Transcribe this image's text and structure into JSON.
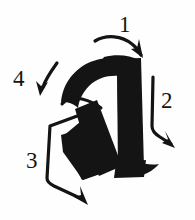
{
  "figure": {
    "glyph": "a",
    "glyph_description": "bold lowercase letter a drawn in thick black brush ink",
    "background_color": "#fefefe",
    "ink_color": "#141414",
    "width": 195,
    "height": 220
  },
  "annotations": {
    "count": 4,
    "items": [
      {
        "label": "1",
        "name": "stroke-1",
        "description": "curved arrow entering from upper left, pointing down-right onto the top arch of the a",
        "label_x": 125,
        "label_y": 32,
        "direction": "right-down"
      },
      {
        "label": "2",
        "name": "stroke-2",
        "description": "vertical arrow on the right side pointing downward along the stem of the a",
        "label_x": 163,
        "label_y": 108,
        "direction": "down"
      },
      {
        "label": "3",
        "name": "stroke-3",
        "description": "bracket arrow on the lower left running down then diagonally right to the baseline",
        "label_x": 26,
        "label_y": 168,
        "direction": "down-right"
      },
      {
        "label": "4",
        "name": "stroke-4",
        "description": "short curved arrow on the upper left pointing down-left into the bowl of the a",
        "label_x": 14,
        "label_y": 86,
        "direction": "down-left"
      }
    ]
  }
}
